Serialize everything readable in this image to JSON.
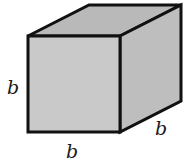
{
  "figure": {
    "type": "cube",
    "colors": {
      "front_face": "#c9c9c9",
      "top_face": "#b9b9b9",
      "side_face": "#bebebe",
      "edge": "#111111",
      "background": "#ffffff"
    },
    "labels": {
      "left_edge": "b",
      "bottom_edge": "b",
      "depth_edge": "b"
    }
  }
}
